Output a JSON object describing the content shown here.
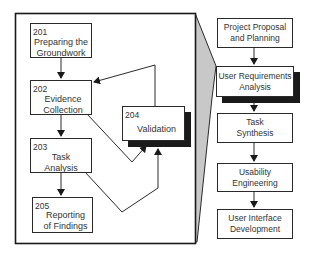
{
  "diagram": {
    "detail_steps": [
      {
        "id": "201",
        "label_line1": "Preparing the",
        "label_line2": "Groundwork"
      },
      {
        "id": "202",
        "label_line1": "Evidence",
        "label_line2": "Collection"
      },
      {
        "id": "203",
        "label_line1": "Task",
        "label_line2": "Analysis"
      },
      {
        "id": "204",
        "label_line1": "Validation",
        "label_line2": ""
      },
      {
        "id": "205",
        "label_line1": "Reporting",
        "label_line2": "of Findings"
      }
    ],
    "phases": [
      {
        "label_line1": "Project Proposal",
        "label_line2": "and Planning",
        "highlighted": false
      },
      {
        "label_line1": "User Requirements",
        "label_line2": "Analysis",
        "highlighted": true
      },
      {
        "label_line1": "Task",
        "label_line2": "Synthesis",
        "highlighted": false
      },
      {
        "label_line1": "Usability",
        "label_line2": "Engineering",
        "highlighted": false
      },
      {
        "label_line1": "User Interface",
        "label_line2": "Development",
        "highlighted": false
      }
    ],
    "colors": {
      "line": "#2a2a2a",
      "funnel_fill": "#c8c8c8",
      "shadow": "#1a1a1a",
      "background": "#ffffff"
    }
  }
}
